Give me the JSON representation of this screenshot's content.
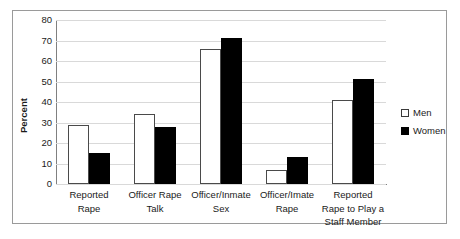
{
  "chart_data": {
    "type": "bar",
    "title": "",
    "xlabel": "",
    "ylabel": "Percent",
    "ylim": [
      0,
      80
    ],
    "ytick_step": 10,
    "yticks": [
      80,
      70,
      60,
      50,
      40,
      30,
      20,
      10,
      0
    ],
    "grid": true,
    "legend_position": "right",
    "categories": [
      "Reported Rape",
      "Officer Rape Talk",
      "Officer/Inmate Sex",
      "Officer/Imate Rape",
      "Reported Rape to Play a Staff Member"
    ],
    "category_lines": [
      [
        "Reported",
        "Rape"
      ],
      [
        "Officer Rape",
        "Talk"
      ],
      [
        "Officer/Inmate",
        "Sex"
      ],
      [
        "Officer/Imate",
        "Rape"
      ],
      [
        "Reported",
        "Rape to Play a",
        "Staff Member"
      ]
    ],
    "series": [
      {
        "name": "Men",
        "color": "#ffffff",
        "edge_color": "#4a4a4a",
        "values": [
          29,
          34,
          66,
          7,
          41
        ]
      },
      {
        "name": "Women",
        "color": "#000000",
        "edge_color": "#000000",
        "values": [
          15,
          28,
          71,
          13,
          51
        ]
      }
    ]
  },
  "legend": {
    "items": [
      {
        "label": "Men",
        "swatch": "hollow-square-icon"
      },
      {
        "label": "Women",
        "swatch": "filled-square-icon"
      }
    ]
  },
  "colors": {
    "frame": "#9a9a9a",
    "axis": "#808080",
    "gridline": "#d9d9d9",
    "text": "#1a1a1a",
    "background": "#ffffff"
  }
}
